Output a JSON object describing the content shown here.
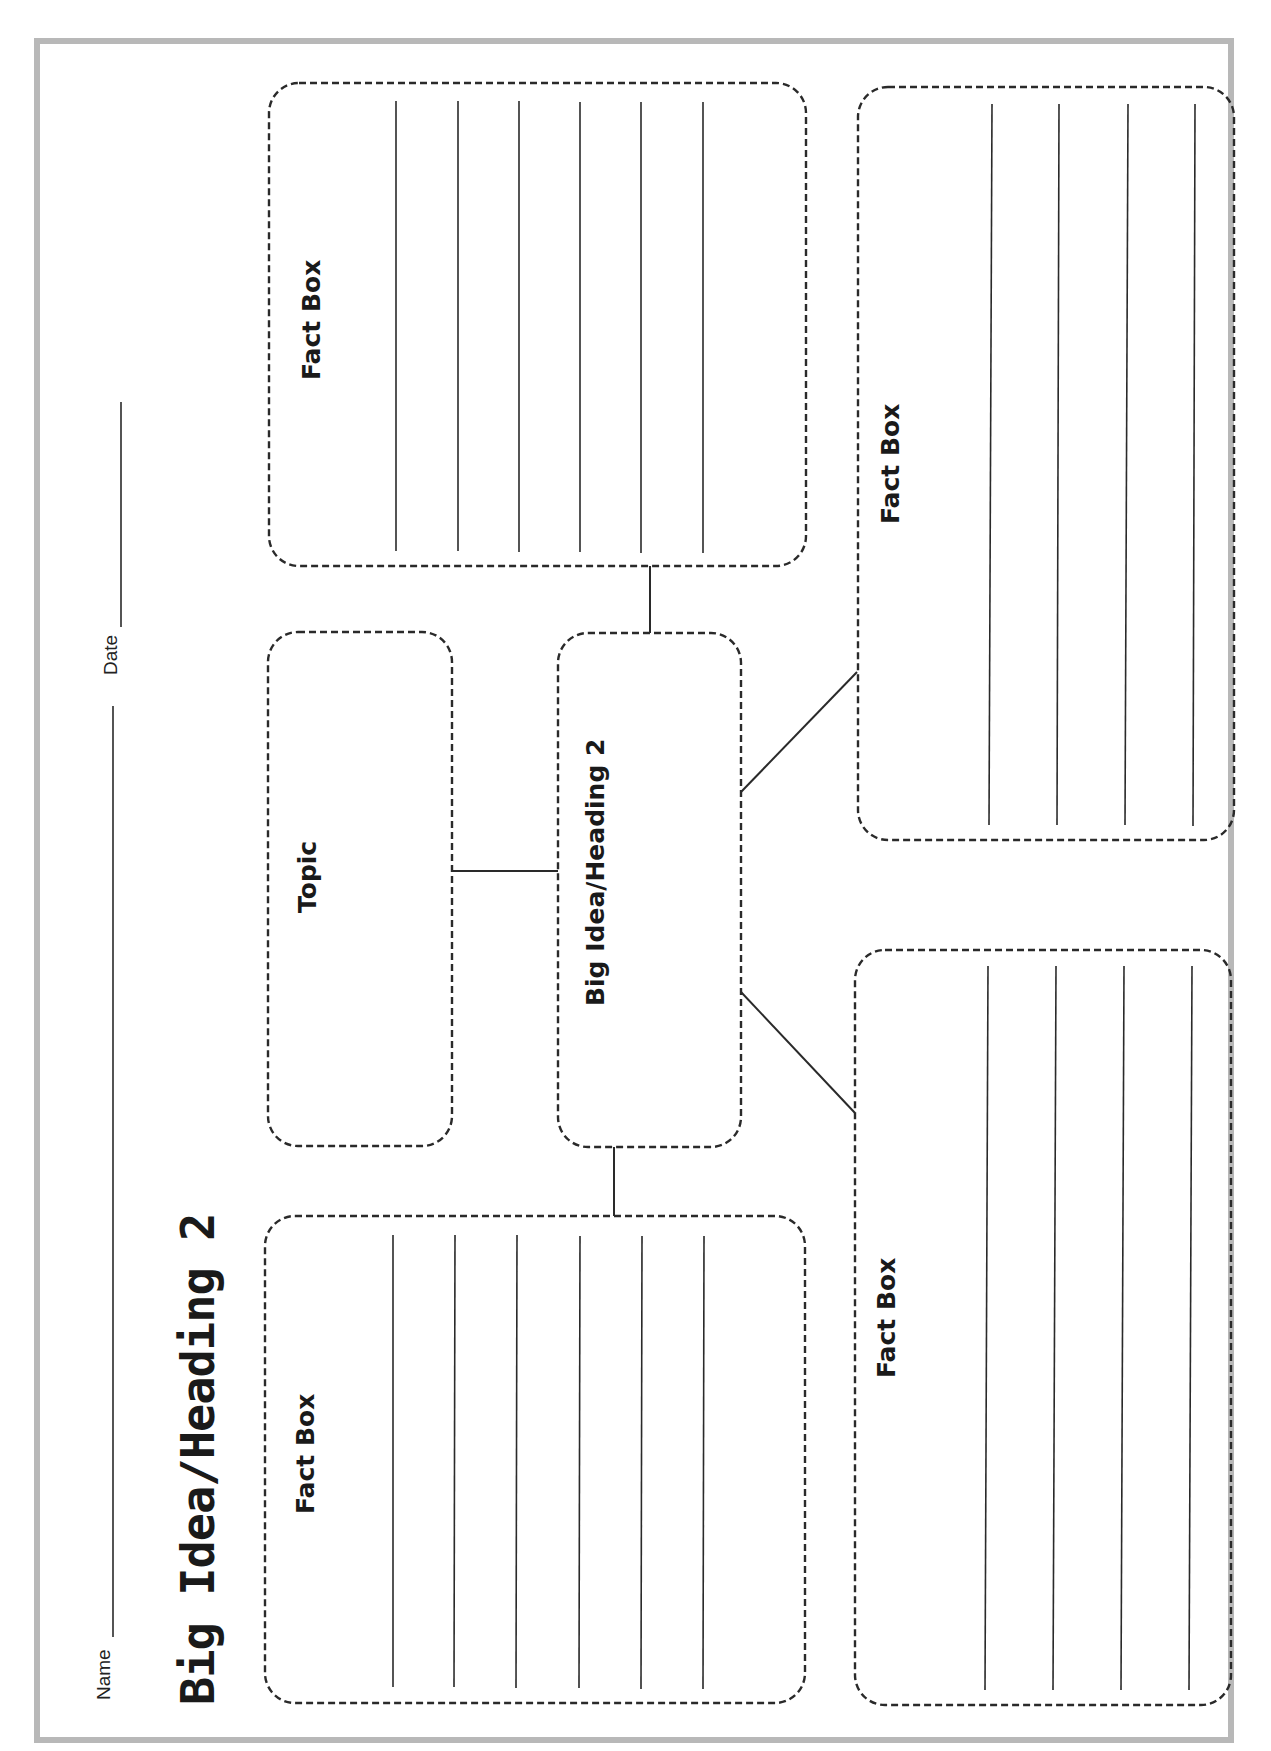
{
  "header": {
    "title": "Big Idea/Heading 2",
    "name_label": "Name",
    "date_label": "Date"
  },
  "organizer": {
    "topic_label": "Topic",
    "big_idea_label": "Big Idea/Heading 2",
    "fact_boxes": [
      {
        "label": "Fact Box",
        "position": "upper-left",
        "lines": 6
      },
      {
        "label": "Fact Box",
        "position": "lower-left",
        "lines": 6
      },
      {
        "label": "Fact Box",
        "position": "upper-right",
        "lines": 4
      },
      {
        "label": "Fact Box",
        "position": "lower-right",
        "lines": 4
      }
    ]
  },
  "colors": {
    "ink": "#2a2a2a",
    "border_gray": "#b8b8b8",
    "background": "#ffffff"
  }
}
